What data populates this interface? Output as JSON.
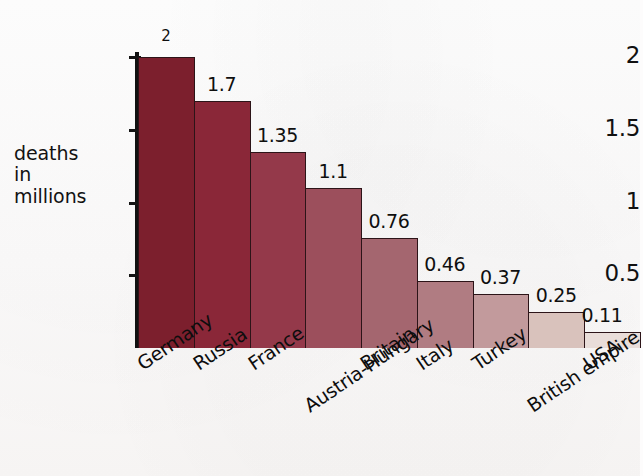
{
  "chart_data": {
    "type": "bar",
    "title": "",
    "xlabel": "",
    "ylabel": "deaths\nin\nmillions",
    "categories": [
      "Germany",
      "Russia",
      "France",
      "Austria-Hungary",
      "Britain",
      "Italy",
      "Turkey",
      "British empire",
      "USA"
    ],
    "values": [
      2,
      1.7,
      1.35,
      1.1,
      0.76,
      0.46,
      0.37,
      0.25,
      0.11
    ],
    "value_labels": [
      "2",
      "1.7",
      "1.35",
      "1.1",
      "0.76",
      "0.46",
      "0.37",
      "0.25",
      "0.11"
    ],
    "ylim": [
      0,
      2.12
    ],
    "ytick_values": [
      0.5,
      1,
      1.5,
      2
    ],
    "ytick_labels": [
      "0.5",
      "1",
      "1.5",
      "2"
    ],
    "grid": false,
    "legend": null,
    "bar_colors": [
      "#7c1f2d",
      "#8a2738",
      "#94394a",
      "#9c4f5c",
      "#a4666f",
      "#b07c82",
      "#c29a9c",
      "#d9c2bc",
      "#e9ddd9"
    ]
  },
  "axis": {
    "y_title": "deaths\nin\nmillions"
  }
}
